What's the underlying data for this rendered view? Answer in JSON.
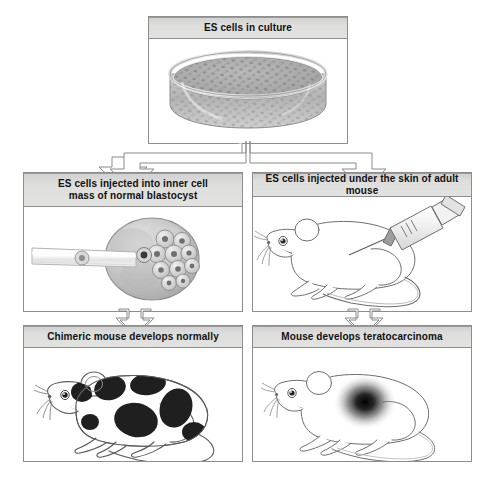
{
  "diagram": {
    "background": "#ffffff",
    "header_fill": "#dedede",
    "border_color": "#8d8d8d",
    "arrow_fill": "#ffffff",
    "arrow_stroke": "#8a8a8a"
  },
  "panels": {
    "top": {
      "label": "ES cells in culture",
      "illustration": "petri-dish-with-es-cells"
    },
    "left_mid": {
      "label_line1": "ES cells injected into inner cell",
      "label_line2": "mass of normal blastocyst",
      "illustration": "pipette-injecting-blastocyst"
    },
    "right_mid": {
      "label": "ES cells injected under the skin of adult mouse",
      "illustration": "mouse-with-syringe"
    },
    "left_bottom": {
      "label": "Chimeric mouse develops normally",
      "illustration": "chimeric-mouse-black-patches"
    },
    "right_bottom": {
      "label": "Mouse develops teratocarcinoma",
      "illustration": "mouse-with-tumor"
    }
  },
  "arrows": [
    {
      "name": "split-arrow-top-to-branches",
      "direction": "down-split"
    },
    {
      "name": "arrow-left-mid-to-left-bottom",
      "direction": "down"
    },
    {
      "name": "arrow-right-mid-to-right-bottom",
      "direction": "down"
    }
  ]
}
